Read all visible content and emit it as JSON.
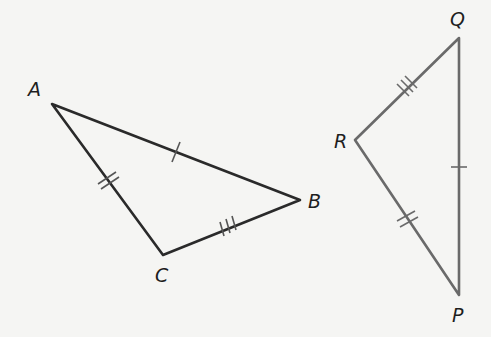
{
  "diagram": {
    "triangle_abc": {
      "vertices": {
        "A": [
          52,
          104
        ],
        "B": [
          300,
          200
        ],
        "C": [
          163,
          255
        ]
      },
      "labels": {
        "A": "A",
        "B": "B",
        "C": "C"
      },
      "marks": {
        "AB": 1,
        "AC": 2,
        "CB": 3
      }
    },
    "triangle_pqr": {
      "vertices": {
        "Q": [
          459,
          38
        ],
        "R": [
          355,
          140
        ],
        "P": [
          459,
          295
        ]
      },
      "labels": {
        "Q": "Q",
        "R": "R",
        "P": "P"
      },
      "marks": {
        "QP": 1,
        "RP": 2,
        "RQ": 3
      }
    },
    "colors": {
      "stroke_abc": "#2a2a2a",
      "stroke_pqr": "#6a6a6a",
      "tick": "#555555"
    }
  }
}
